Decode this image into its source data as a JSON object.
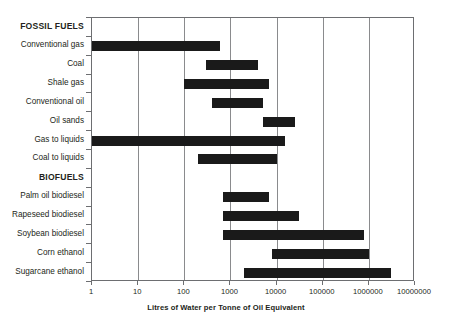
{
  "chart_data": {
    "type": "bar",
    "orientation": "horizontal",
    "subtype": "range-bar",
    "title": "",
    "xlabel": "Litres of Water per Tonne of Oil Equivalent",
    "ylabel": "",
    "xscale": "log",
    "xlim": [
      1,
      10000000
    ],
    "xticks": [
      1,
      10,
      100,
      1000,
      10000,
      100000,
      1000000,
      10000000
    ],
    "xticklabels": [
      "1",
      "10",
      "100",
      "1000",
      "10000",
      "100000",
      "1000000",
      "10000000"
    ],
    "grid": true,
    "grid_axis": "x",
    "legend": "none",
    "bar_color": "#1a1a1a",
    "groups": [
      {
        "name": "FOSSIL FUELS",
        "categories": [
          {
            "label": "Conventional gas",
            "low": 1,
            "high": 600
          },
          {
            "label": "Coal",
            "low": 300,
            "high": 4000
          },
          {
            "label": "Shale gas",
            "low": 100,
            "high": 7000
          },
          {
            "label": "Conventional oil",
            "low": 400,
            "high": 5000
          },
          {
            "label": "Oil sands",
            "low": 5000,
            "high": 25000
          },
          {
            "label": "Gas to liquids",
            "low": 1,
            "high": 15000
          },
          {
            "label": "Coal to liquids",
            "low": 200,
            "high": 10000
          }
        ]
      },
      {
        "name": "BIOFUELS",
        "categories": [
          {
            "label": "Palm oil biodiesel",
            "low": 700,
            "high": 7000
          },
          {
            "label": "Rapeseed biodiesel",
            "low": 700,
            "high": 30000
          },
          {
            "label": "Soybean biodiesel",
            "low": 700,
            "high": 800000
          },
          {
            "label": "Corn ethanol",
            "low": 8000,
            "high": 1000000
          },
          {
            "label": "Sugarcane ethanol",
            "low": 2000,
            "high": 3000000
          }
        ]
      }
    ]
  }
}
